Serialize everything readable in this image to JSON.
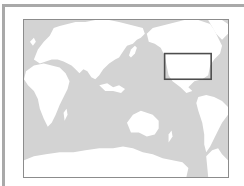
{
  "map": {
    "projection": "pacific-centered world map",
    "ocean_color": "#d3d3d3",
    "land_color": "#ffffff",
    "frame_color": "#a9a9a9",
    "highlight": {
      "label": "United States",
      "stroke_color": "#4d4d4d",
      "box": {
        "x": 142,
        "y": 34,
        "width": 47,
        "height": 26
      }
    }
  }
}
